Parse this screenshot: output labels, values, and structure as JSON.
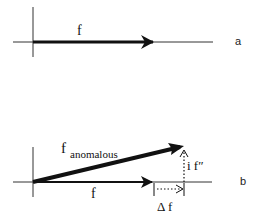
{
  "panel_a": {
    "label": "a",
    "vector_label": "f"
  },
  "panel_b": {
    "label": "b",
    "anomalous_label_main": "f",
    "anomalous_label_sub": "anomalous",
    "normal_label": "f",
    "imag_label": "i f″",
    "delta_label": "Δ f"
  },
  "colors": {
    "stroke": "#111111",
    "axis": "#333333",
    "background": "#ffffff"
  }
}
